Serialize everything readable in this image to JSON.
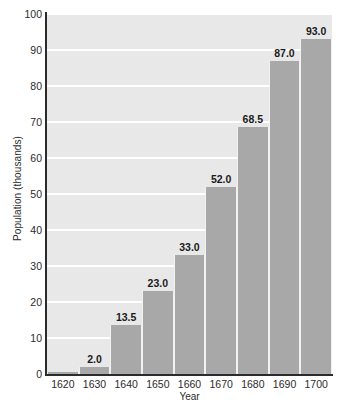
{
  "chart_data": {
    "type": "bar",
    "title": "",
    "xlabel": "Year",
    "ylabel": "Population (thousands)",
    "categories": [
      "1620",
      "1630",
      "1640",
      "1650",
      "1660",
      "1670",
      "1680",
      "1690",
      "1700"
    ],
    "values": [
      0.5,
      2.0,
      13.5,
      23.0,
      33.0,
      52.0,
      68.5,
      87.0,
      93.0
    ],
    "data_labels": [
      "",
      "2.0",
      "13.5",
      "23.0",
      "33.0",
      "52.0",
      "68.5",
      "87.0",
      "93.0"
    ],
    "ylim": [
      0,
      100
    ],
    "yticks": [
      0,
      10,
      20,
      30,
      40,
      50,
      60,
      70,
      80,
      90,
      100
    ],
    "ytick_labels": [
      "0",
      "10",
      "20",
      "30",
      "40",
      "50",
      "60",
      "70",
      "80",
      "90",
      "100"
    ],
    "grid": true,
    "grid_orientation": "horizontal",
    "legend": false,
    "legend_position": "none",
    "colors": {
      "bar_fill": "#a8a8a8",
      "plot_background": "#e8e8e8",
      "gridline": "#ffffff",
      "axis_line": "#2b2b2b",
      "text": "#2b2b2b",
      "page_background": "#ffffff"
    }
  }
}
